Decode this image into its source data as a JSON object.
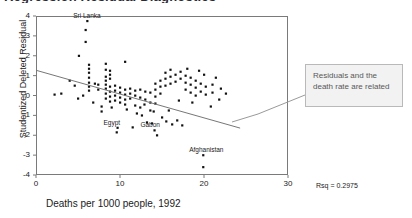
{
  "figure": {
    "cropped_title": "Regression Residual Diagnostics"
  },
  "annotation_box": {
    "text": "Residuals and the death rate are related",
    "border_color": "#b9b9b9",
    "fill_color": "#f2f2f2",
    "text_color": "#585858"
  },
  "stats": {
    "rsq_label": "Rsq = 0.2975"
  },
  "chart_data": {
    "type": "scatter",
    "title": "",
    "xlabel": "Deaths per 1000 people, 1992",
    "ylabel": "Studentized Deleted Residual",
    "xlim": [
      0,
      30
    ],
    "ylim": [
      -4,
      4
    ],
    "xticks": [
      0,
      10,
      20,
      30
    ],
    "yticks": [
      4,
      3,
      2,
      1,
      0,
      -1,
      -2,
      -3,
      -4
    ],
    "grid": false,
    "legend": null,
    "marker_color": "#111111",
    "fit_line": {
      "color": "#777777",
      "x": [
        0,
        24.3
      ],
      "y": [
        1.27,
        -1.64
      ]
    },
    "annotations": [
      {
        "label": "Sri Lanka",
        "x": 6.1,
        "y": 3.75
      },
      {
        "label": "Egypt",
        "x": 9.7,
        "y": -1.62
      },
      {
        "label": "Gabon",
        "x": 14.1,
        "y": -1.75
      },
      {
        "label": "Afghanistan",
        "x": 19.9,
        "y": -3.0
      }
    ],
    "points": [
      [
        5.9,
        3.3
      ],
      [
        5.9,
        2.7
      ],
      [
        5.1,
        2.0
      ],
      [
        6.3,
        1.55
      ],
      [
        6.3,
        1.35
      ],
      [
        6.3,
        1.15
      ],
      [
        8.3,
        1.6
      ],
      [
        8.3,
        1.3
      ],
      [
        8.8,
        1.25
      ],
      [
        8.8,
        1.05
      ],
      [
        8.8,
        0.85
      ],
      [
        10.6,
        1.7
      ],
      [
        8.3,
        0.95
      ],
      [
        8.3,
        0.75
      ],
      [
        6.3,
        0.9
      ],
      [
        6.3,
        0.65
      ],
      [
        6.3,
        0.45
      ],
      [
        6.3,
        0.25
      ],
      [
        7.0,
        0.6
      ],
      [
        7.4,
        0.55
      ],
      [
        7.4,
        0.3
      ],
      [
        4.0,
        0.75
      ],
      [
        4.6,
        0.5
      ],
      [
        2.2,
        0.05
      ],
      [
        3.0,
        0.1
      ],
      [
        8.3,
        0.55
      ],
      [
        8.3,
        0.35
      ],
      [
        8.3,
        0.1
      ],
      [
        8.3,
        -0.15
      ],
      [
        8.8,
        0.45
      ],
      [
        8.8,
        0.2
      ],
      [
        8.8,
        -0.05
      ],
      [
        8.8,
        -0.3
      ],
      [
        9.4,
        0.5
      ],
      [
        9.4,
        0.25
      ],
      [
        9.4,
        0.0
      ],
      [
        9.4,
        -0.25
      ],
      [
        10.0,
        0.4
      ],
      [
        10.0,
        0.15
      ],
      [
        10.0,
        -0.1
      ],
      [
        10.0,
        -0.35
      ],
      [
        10.6,
        0.3
      ],
      [
        10.6,
        0.05
      ],
      [
        10.6,
        -0.2
      ],
      [
        10.6,
        -0.45
      ],
      [
        11.2,
        0.35
      ],
      [
        11.2,
        0.1
      ],
      [
        11.2,
        -0.15
      ],
      [
        11.8,
        0.25
      ],
      [
        11.8,
        0.0
      ],
      [
        11.8,
        -0.5
      ],
      [
        12.4,
        0.3
      ],
      [
        12.4,
        -0.1
      ],
      [
        12.4,
        -0.6
      ],
      [
        13.0,
        0.2
      ],
      [
        13.0,
        -0.2
      ],
      [
        13.6,
        0.15
      ],
      [
        13.6,
        -0.35
      ],
      [
        13.6,
        -0.75
      ],
      [
        14.2,
        0.6
      ],
      [
        14.2,
        0.3
      ],
      [
        14.2,
        -0.05
      ],
      [
        14.2,
        -0.4
      ],
      [
        14.8,
        0.75
      ],
      [
        14.8,
        0.45
      ],
      [
        14.8,
        0.1
      ],
      [
        15.4,
        1.15
      ],
      [
        15.4,
        0.85
      ],
      [
        15.4,
        0.5
      ],
      [
        16.0,
        1.3
      ],
      [
        16.0,
        0.95
      ],
      [
        16.0,
        0.6
      ],
      [
        16.6,
        1.05
      ],
      [
        16.6,
        0.7
      ],
      [
        17.2,
        1.2
      ],
      [
        17.2,
        0.85
      ],
      [
        17.8,
        1.0
      ],
      [
        17.8,
        0.65
      ],
      [
        17.8,
        0.3
      ],
      [
        18.4,
        0.9
      ],
      [
        18.4,
        0.55
      ],
      [
        18.4,
        0.15
      ],
      [
        19.0,
        0.75
      ],
      [
        19.0,
        0.4
      ],
      [
        19.0,
        0.0
      ],
      [
        19.6,
        0.6
      ],
      [
        19.6,
        0.2
      ],
      [
        20.2,
        0.45
      ],
      [
        20.2,
        0.05
      ],
      [
        21.0,
        0.55
      ],
      [
        21.0,
        0.15
      ],
      [
        22.0,
        0.35
      ],
      [
        22.6,
        0.1
      ],
      [
        12.0,
        -0.9
      ],
      [
        12.6,
        -1.0
      ],
      [
        14.0,
        -0.8
      ],
      [
        15.0,
        -1.1
      ],
      [
        13.2,
        -1.35
      ],
      [
        13.8,
        -1.4
      ],
      [
        15.5,
        -1.3
      ],
      [
        16.2,
        -1.45
      ],
      [
        16.8,
        -1.25
      ],
      [
        17.4,
        -1.5
      ],
      [
        9.6,
        -1.85
      ],
      [
        14.4,
        -2.0
      ],
      [
        19.9,
        -3.6
      ],
      [
        5.0,
        -0.15
      ],
      [
        5.6,
        0.0
      ],
      [
        7.8,
        -0.55
      ],
      [
        7.8,
        -0.8
      ],
      [
        9.0,
        -0.6
      ],
      [
        10.8,
        -0.7
      ],
      [
        21.8,
        -0.2
      ],
      [
        20.8,
        -0.55
      ],
      [
        11.5,
        -1.6
      ],
      [
        12.9,
        -0.45
      ],
      [
        6.8,
        -0.35
      ],
      [
        17.0,
        -0.25
      ],
      [
        18.6,
        -0.35
      ],
      [
        15.8,
        -0.75
      ],
      [
        21.4,
        0.9
      ],
      [
        20.0,
        1.05
      ],
      [
        18.0,
        1.35
      ],
      [
        19.4,
        1.25
      ]
    ]
  }
}
